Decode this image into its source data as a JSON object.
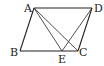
{
  "diagram": {
    "type": "geometry",
    "shape": "parallelogram ABCD",
    "points": {
      "A": {
        "label": "A",
        "x": 34,
        "y": 8
      },
      "B": {
        "label": "B",
        "x": 20,
        "y": 51
      },
      "C": {
        "label": "C",
        "x": 78,
        "y": 51
      },
      "D": {
        "label": "D",
        "x": 92,
        "y": 8
      },
      "E": {
        "label": "E",
        "x": 62,
        "y": 51
      }
    },
    "segments": [
      "AB",
      "BC",
      "CD",
      "DA",
      "AE",
      "AC",
      "DE"
    ]
  }
}
